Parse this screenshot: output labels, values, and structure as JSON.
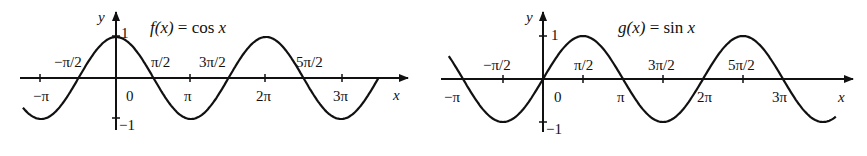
{
  "chart_data": [
    {
      "type": "line",
      "title": "f(x) = cos x",
      "xlabel": "x",
      "ylabel": "y",
      "x_ticks": [
        "−π",
        "−π/2",
        "0",
        "π/2",
        "π",
        "3π/2",
        "2π",
        "5π/2",
        "3π"
      ],
      "x_tick_values": [
        -3.1416,
        -1.5708,
        0,
        1.5708,
        3.1416,
        4.7124,
        6.2832,
        7.854,
        9.4248
      ],
      "y_ticks": [
        "1",
        "−1"
      ],
      "y_tick_values": [
        1,
        -1
      ],
      "xlim": [
        -3.9,
        11.2
      ],
      "ylim": [
        -1.2,
        1.3
      ],
      "series": [
        {
          "name": "cos x",
          "function": "cos",
          "x_range": [
            -3.9,
            11.0
          ]
        }
      ],
      "grid": false
    },
    {
      "type": "line",
      "title": "g(x) = sin x",
      "xlabel": "x",
      "ylabel": "y",
      "x_ticks": [
        "−π",
        "−π/2",
        "0",
        "π/2",
        "π",
        "3π/2",
        "2π",
        "5π/2",
        "3π"
      ],
      "x_tick_values": [
        -3.1416,
        -1.5708,
        0,
        1.5708,
        3.1416,
        4.7124,
        6.2832,
        7.854,
        9.4248
      ],
      "y_ticks": [
        "1",
        "−1"
      ],
      "y_tick_values": [
        1,
        -1
      ],
      "xlim": [
        -3.9,
        11.2
      ],
      "ylim": [
        -1.2,
        1.3
      ],
      "series": [
        {
          "name": "sin x",
          "function": "sin",
          "x_range": [
            -3.7,
            11.5
          ]
        }
      ],
      "grid": false
    }
  ],
  "left": {
    "title_fx": "f(x)",
    "title_rest": " = cos ",
    "title_x": "x",
    "axis_x": "x",
    "axis_y": "y",
    "labels": {
      "neg_pi": "−π",
      "neg_half_pi": "−π/2",
      "zero": "0",
      "half_pi": "π/2",
      "pi": "π",
      "three_half_pi": "3π/2",
      "two_pi": "2π",
      "five_half_pi": "5π/2",
      "three_pi": "3π",
      "one": "1",
      "neg_one": "−1"
    }
  },
  "right": {
    "title_fx": "g(x)",
    "title_rest": " = sin ",
    "title_x": "x",
    "axis_x": "x",
    "axis_y": "y",
    "labels": {
      "neg_pi": "−π",
      "neg_half_pi": "−π/2",
      "zero": "0",
      "half_pi": "π/2",
      "pi": "π",
      "three_half_pi": "3π/2",
      "two_pi": "2π",
      "five_half_pi": "5π/2",
      "three_pi": "3π",
      "one": "1",
      "neg_one": "−1"
    }
  }
}
